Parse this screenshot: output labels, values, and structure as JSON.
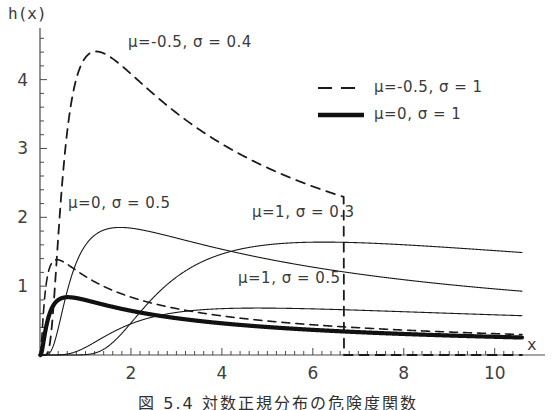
{
  "figure": {
    "caption": "図 5.4  対数正規分布の危険度関数",
    "y_axis_label": "h(x)",
    "x_axis_label": "x"
  },
  "chart_data": {
    "type": "line",
    "title": "",
    "xlabel": "x",
    "ylabel": "h(x)",
    "xlim": [
      0,
      10.6
    ],
    "ylim": [
      0,
      4.75
    ],
    "xticks": [
      2,
      4,
      6,
      8,
      10
    ],
    "yticks": [
      1,
      2,
      3,
      4
    ],
    "xtick_labels": [
      "2",
      "4",
      "6",
      "8",
      "10"
    ],
    "ytick_labels": [
      "1",
      "2",
      "3",
      "4"
    ],
    "minor_ticks": true,
    "grid": false,
    "legend_position": "upper-right-inside",
    "series": [
      {
        "name": "mu=-0.5, sigma=0.4",
        "mu": -0.5,
        "sigma": 0.4,
        "style": "dashed",
        "width": 1.8,
        "color": "#1a1a1a",
        "peak_x": 1.1,
        "peak_y": 4.45,
        "value_at_10": 1.8
      },
      {
        "name": "mu=0, sigma=0.5",
        "mu": 0.0,
        "sigma": 0.5,
        "style": "solid",
        "width": 1.1,
        "color": "#1a1a1a",
        "peak_x": 1.6,
        "peak_y": 1.82,
        "value_at_10": 1.0
      },
      {
        "name": "mu=1, sigma=0.3",
        "mu": 1.0,
        "sigma": 0.3,
        "style": "solid",
        "width": 1.1,
        "color": "#1a1a1a",
        "peak_x": 4.2,
        "peak_y": 1.72,
        "value_at_10": 1.55
      },
      {
        "name": "mu=1, sigma=0.5",
        "mu": 1.0,
        "sigma": 0.5,
        "style": "solid",
        "width": 1.1,
        "color": "#1a1a1a",
        "peak_x": 4.6,
        "peak_y": 0.78,
        "value_at_10": 0.62
      },
      {
        "name": "mu=-0.5, sigma=1",
        "mu": -0.5,
        "sigma": 1.0,
        "style": "dashed",
        "width": 1.6,
        "color": "#1a1a1a",
        "peak_x": 0.95,
        "peak_y": 0.84,
        "value_at_10": 0.3
      },
      {
        "name": "mu=0, sigma=1",
        "mu": 0.0,
        "sigma": 1.0,
        "style": "solid-thick",
        "width": 4.2,
        "color": "#111111",
        "peak_x": 0.58,
        "peak_y": 0.72,
        "value_at_10": 0.32
      }
    ],
    "annotations": [
      {
        "id": "annot-mu-m05-s04",
        "text": "μ=-0.5, σ = 0.4",
        "x_px": 128,
        "y_px": 33
      },
      {
        "id": "annot-mu-0-s05",
        "text": "μ=0, σ = 0.5",
        "x_px": 68,
        "y_px": 194
      },
      {
        "id": "annot-mu-1-s03",
        "text": "μ=1, σ = 0.3",
        "x_px": 252,
        "y_px": 203
      },
      {
        "id": "annot-mu-1-s05",
        "text": "μ=1, σ = 0.5",
        "x_px": 238,
        "y_px": 269
      }
    ],
    "legend": [
      {
        "id": "legend-mu-m05-s1",
        "text": "μ=-0.5, σ = 1",
        "style": "dashed"
      },
      {
        "id": "legend-mu-0-s1",
        "text": "μ=0, σ = 1",
        "style": "solid-thick"
      }
    ]
  }
}
